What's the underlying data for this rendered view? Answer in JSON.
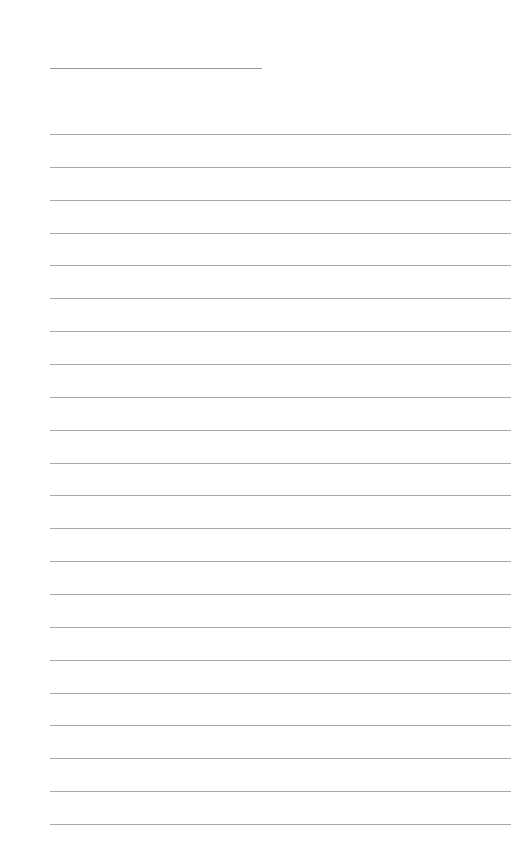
{
  "page": {
    "type": "lined-paper",
    "title_line": {
      "left": 50,
      "top": 68,
      "width": 212
    },
    "rules": {
      "count": 22,
      "first_top": 134,
      "spacing": 32.86,
      "left": 50,
      "width": 461
    },
    "colors": {
      "background": "#ffffff",
      "rule": "#a8a8a8",
      "title_line": "#9a9a9a"
    }
  }
}
